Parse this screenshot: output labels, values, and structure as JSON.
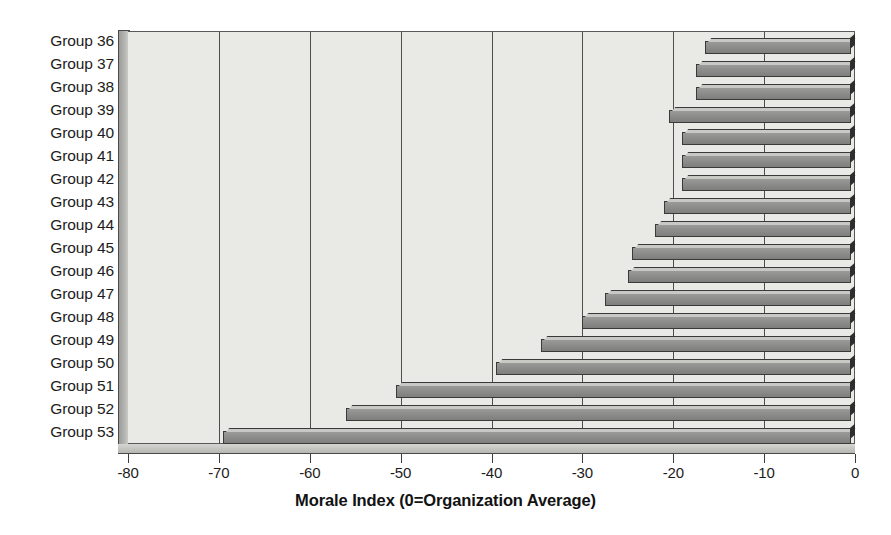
{
  "chart_data": {
    "type": "bar",
    "orientation": "horizontal",
    "title": "",
    "xlabel": "Morale Index (0=Organization Average)",
    "ylabel": "",
    "xlim": [
      -80,
      0
    ],
    "xticks": [
      -80,
      -70,
      -60,
      -50,
      -40,
      -30,
      -20,
      -10,
      0
    ],
    "xticklabels": [
      "-80",
      "-70",
      "-60",
      "-50",
      "-40",
      "-30",
      "-20",
      "-10",
      "0"
    ],
    "grid": "vertical",
    "legend": "none",
    "categories": [
      "Group 36",
      "Group 37",
      "Group 38",
      "Group 39",
      "Group 40",
      "Group 41",
      "Group 42",
      "Group 43",
      "Group 44",
      "Group 45",
      "Group 46",
      "Group 47",
      "Group 48",
      "Group 49",
      "Group 50",
      "Group 51",
      "Group 52",
      "Group 53"
    ],
    "values": [
      -16.5,
      -17.5,
      -17.5,
      -20.5,
      -19,
      -19,
      -19,
      -21,
      -22,
      -24.5,
      -25,
      -27.5,
      -30,
      -34.5,
      -39.5,
      -50.5,
      -56,
      -69.5
    ],
    "bar_color": "#8d8d8b",
    "bar_edge_color": "#3a3a3a",
    "plot_background": "#e9e9e6",
    "gridline_color": "#4d4d4d",
    "text_color": "#1c1c1c"
  }
}
